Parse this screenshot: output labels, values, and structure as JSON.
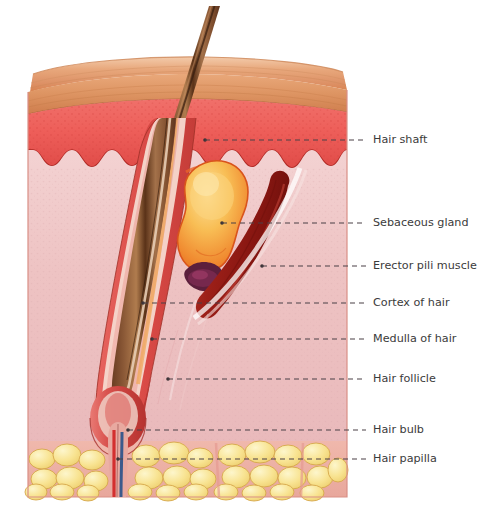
{
  "figure": {
    "background_color": "#ffffff"
  },
  "palette": {
    "epidermis_surface": "#e5a077",
    "epidermis_surface_light": "#f0c3a0",
    "epidermis": "#ee5f5a",
    "epidermis_dark": "#c8372f",
    "dermis": "#edbfc0",
    "dermis_light": "#f3d3d3",
    "fat": "#f7e08a",
    "fat_light": "#fdf3c2",
    "fat_outline": "#d9a94e",
    "hair_shaft": "#8b5a3c",
    "hair_shaft_dark": "#4a2a18",
    "hair_shaft_light": "#c08a5e",
    "sebaceous_gland": "#f5a83c",
    "sebaceous_gland_light": "#fbd27a",
    "sebaceous_gland_edge": "#e8642a",
    "erector_muscle": "#9c1f18",
    "erector_muscle_light": "#c8352a",
    "follicle_sheath": "#e04c4c",
    "follicle_inner": "#f0a85a",
    "papilla_artery": "#d32f2f",
    "papilla_vein": "#3b5a8c",
    "duct_dark": "#5c1f3c",
    "label_text": "#3b3b3b",
    "leader_line": "#4a4146"
  },
  "structures": [
    {
      "id": "hair-shaft",
      "name": "Hair shaft"
    },
    {
      "id": "sebaceous-gland",
      "name": "Sebaceous gland"
    },
    {
      "id": "erector-pili-muscle",
      "name": "Erector pili muscle"
    },
    {
      "id": "cortex-of-hair",
      "name": "Cortex of hair"
    },
    {
      "id": "medulla-of-hair",
      "name": "Medulla of hair"
    },
    {
      "id": "hair-follicle",
      "name": "Hair follicle"
    },
    {
      "id": "hair-bulb",
      "name": "Hair bulb"
    },
    {
      "id": "hair-papilla",
      "name": "Hair papilla"
    }
  ],
  "labels": [
    {
      "id": "hair-shaft",
      "text": "Hair shaft",
      "text_x": 373,
      "text_y": 140,
      "leader_x1": 205,
      "leader_y1": 140,
      "leader_x2": 366,
      "leader_y2": 140,
      "dot_x": 205,
      "dot_y": 140
    },
    {
      "id": "sebaceous-gland",
      "text": "Sebaceous gland",
      "text_x": 373,
      "text_y": 223,
      "leader_x1": 222,
      "leader_y1": 223,
      "leader_x2": 366,
      "leader_y2": 223,
      "dot_x": 222,
      "dot_y": 223
    },
    {
      "id": "erector-pili-muscle",
      "text": "Erector pili muscle",
      "text_x": 373,
      "text_y": 266,
      "leader_x1": 262,
      "leader_y1": 266,
      "leader_x2": 366,
      "leader_y2": 266,
      "dot_x": 262,
      "dot_y": 266
    },
    {
      "id": "cortex-of-hair",
      "text": "Cortex of hair",
      "text_x": 373,
      "text_y": 303,
      "leader_x1": 143,
      "leader_y1": 303,
      "leader_x2": 366,
      "leader_y2": 303,
      "dot_x": 143,
      "dot_y": 303
    },
    {
      "id": "medulla-of-hair",
      "text": "Medulla of hair",
      "text_x": 373,
      "text_y": 339,
      "leader_x1": 152,
      "leader_y1": 339,
      "leader_x2": 366,
      "leader_y2": 339,
      "dot_x": 152,
      "dot_y": 339
    },
    {
      "id": "hair-follicle",
      "text": "Hair follicle",
      "text_x": 373,
      "text_y": 379,
      "leader_x1": 168,
      "leader_y1": 379,
      "leader_x2": 366,
      "leader_y2": 379,
      "dot_x": 168,
      "dot_y": 379
    },
    {
      "id": "hair-bulb",
      "text": "Hair bulb",
      "text_x": 373,
      "text_y": 430,
      "leader_x1": 128,
      "leader_y1": 430,
      "leader_x2": 366,
      "leader_y2": 430,
      "dot_x": 128,
      "dot_y": 430
    },
    {
      "id": "hair-papilla",
      "text": "Hair papilla",
      "text_x": 373,
      "text_y": 459,
      "leader_x1": 118,
      "leader_y1": 459,
      "leader_x2": 366,
      "leader_y2": 459,
      "dot_x": 118,
      "dot_y": 459
    }
  ],
  "geometry": {
    "block_left": 28,
    "block_right": 347,
    "block_top_front": 88,
    "block_bottom": 497,
    "epidermis_bottom": 150,
    "fat_top": 443
  }
}
